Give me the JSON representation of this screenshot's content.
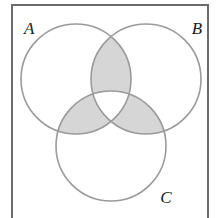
{
  "figure": {
    "kind": "venn-3-set",
    "background_color": "#ffffff"
  },
  "frame": {
    "name": "diagram-border",
    "stroke_color": "#6b6b6b",
    "stroke_width": 2,
    "x": 12,
    "y": 5,
    "width": 196,
    "height": 220,
    "note": "bottom edge cropped off image"
  },
  "sets": [
    {
      "id": "A",
      "label": "A",
      "label_x": 24,
      "label_y": 34,
      "cx": 76,
      "cy": 79,
      "r": 55,
      "stroke_color": "#9a9a9a",
      "fill_color": "#ffffff"
    },
    {
      "id": "B",
      "label": "B",
      "label_x": 197,
      "label_y": 34,
      "cx": 146,
      "cy": 79,
      "r": 55,
      "stroke_color": "#9a9a9a",
      "fill_color": "#ffffff"
    },
    {
      "id": "C",
      "label": "C",
      "label_x": 166,
      "label_y": 203,
      "cx": 111,
      "cy": 146,
      "r": 55,
      "stroke_color": "#9a9a9a",
      "fill_color": "#ffffff"
    }
  ],
  "shading": {
    "fill_color": "#d6d6d6",
    "opacity": 1,
    "description": "pairwise intersections shaded, triple intersection unshaded",
    "shaded_regions": [
      "A∩B only",
      "A∩C only",
      "B∩C only"
    ],
    "unshaded_regions": [
      "A only",
      "B only",
      "C only",
      "A∩B∩C",
      "outside all sets"
    ]
  },
  "chart_data": {
    "type": "venn",
    "sets": [
      "A",
      "B",
      "C"
    ],
    "regions": [
      {
        "id": "A",
        "label": "A only",
        "shaded": false
      },
      {
        "id": "B",
        "label": "B only",
        "shaded": false
      },
      {
        "id": "C",
        "label": "C only",
        "shaded": false
      },
      {
        "id": "AB",
        "label": "A∩B only",
        "shaded": true
      },
      {
        "id": "AC",
        "label": "A∩C only",
        "shaded": true
      },
      {
        "id": "BC",
        "label": "B∩C only",
        "shaded": true
      },
      {
        "id": "ABC",
        "label": "A∩B∩C",
        "shaded": false
      },
      {
        "id": "U",
        "label": "universe outside sets",
        "shaded": false
      }
    ],
    "legend": null,
    "xlabel": "",
    "ylabel": ""
  }
}
